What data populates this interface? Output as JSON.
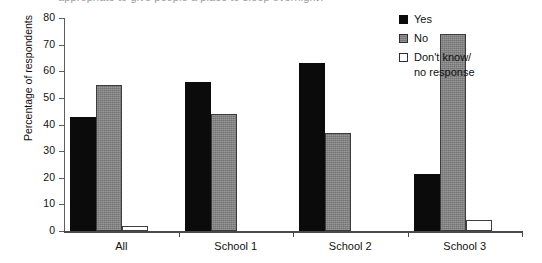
{
  "figure": {
    "clipped_title_sliver": "appropriate to give people a place to sleep overnight?",
    "ylabel": "Percentage of respondents"
  },
  "legend": {
    "position": "top-right",
    "items": [
      {
        "name": "legend-yes",
        "label": "Yes",
        "color": "#0b0b0b"
      },
      {
        "name": "legend-no",
        "label": "No",
        "color": "#828282"
      },
      {
        "name": "legend-dont-know",
        "label": "Don't know/\nno response",
        "color": "#ffffff"
      }
    ]
  },
  "chart_data": {
    "type": "bar",
    "title": "",
    "xlabel": "",
    "ylabel": "Percentage of respondents",
    "categories": [
      "All",
      "School 1",
      "School 2",
      "School 3"
    ],
    "series": [
      {
        "name": "Yes",
        "color": "#0b0b0b",
        "values": [
          43,
          56,
          63,
          21.5
        ]
      },
      {
        "name": "No",
        "color": "#828282",
        "values": [
          55,
          44,
          37,
          74
        ]
      },
      {
        "name": "Don't know/ no response",
        "color": "#ffffff",
        "values": [
          2,
          0,
          0,
          4
        ]
      }
    ],
    "ylim": [
      0,
      80
    ],
    "yticks": [
      0,
      10,
      20,
      30,
      40,
      50,
      60,
      70,
      80
    ],
    "ytick_labels": [
      "0",
      "10",
      "20",
      "30",
      "40",
      "50",
      "60",
      "70",
      "80"
    ],
    "grid": false,
    "legend_position": "top-right"
  }
}
